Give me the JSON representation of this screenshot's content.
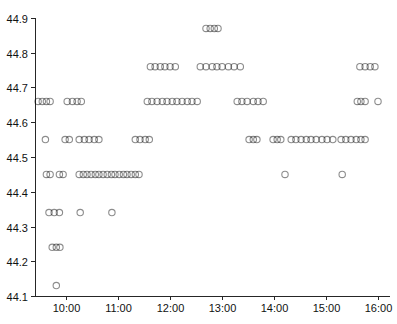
{
  "chart_data": {
    "type": "scatter",
    "title": "",
    "xlabel": "",
    "ylabel": "",
    "grid": false,
    "legend_position": "none",
    "background": "#ffffff",
    "axis_color": "#262626",
    "label_color": "#111111",
    "xlim_hours": [
      9.4,
      16.23
    ],
    "ylim": [
      44.1,
      44.9
    ],
    "x_ticks": [
      {
        "hour": 10,
        "label": "10:00"
      },
      {
        "hour": 11,
        "label": "11:00"
      },
      {
        "hour": 12,
        "label": "12:00"
      },
      {
        "hour": 13,
        "label": "13:00"
      },
      {
        "hour": 14,
        "label": "14:00"
      },
      {
        "hour": 15,
        "label": "15:00"
      },
      {
        "hour": 16,
        "label": "16:00"
      }
    ],
    "y_ticks": [
      {
        "value": 44.1,
        "label": "44.1"
      },
      {
        "value": 44.2,
        "label": "44.2"
      },
      {
        "value": 44.3,
        "label": "44.3"
      },
      {
        "value": 44.4,
        "label": "44.4"
      },
      {
        "value": 44.5,
        "label": "44.5"
      },
      {
        "value": 44.6,
        "label": "44.6"
      },
      {
        "value": 44.7,
        "label": "44.7"
      },
      {
        "value": 44.8,
        "label": "44.8"
      },
      {
        "value": 44.9,
        "label": "44.9"
      }
    ],
    "marker": {
      "shape": "circle",
      "radius": 3.2,
      "stroke": "rgba(0,0,0,0.45)",
      "stroke_width": 1.1,
      "fill": "none"
    },
    "series": [
      {
        "name": "price-observations",
        "levels": [
          {
            "price": 44.87,
            "times": [
              12.69,
              12.77,
              12.85,
              12.92
            ]
          },
          {
            "price": 44.76,
            "times": [
              11.62,
              11.71,
              11.81,
              11.9,
              12.0,
              12.1,
              12.58,
              12.69,
              12.81,
              12.9,
              13.0,
              13.12,
              13.23,
              13.35,
              15.65,
              15.75,
              15.85,
              15.94
            ]
          },
          {
            "price": 44.66,
            "times": [
              9.46,
              9.54,
              9.62,
              9.69,
              10.02,
              10.12,
              10.21,
              10.29,
              11.56,
              11.65,
              11.75,
              11.85,
              11.94,
              12.04,
              12.13,
              12.23,
              12.33,
              12.42,
              12.52,
              13.29,
              13.38,
              13.48,
              13.6,
              13.69,
              13.79,
              15.6,
              15.67,
              15.75,
              16.0
            ]
          },
          {
            "price": 44.55,
            "times": [
              9.6,
              9.98,
              10.06,
              10.25,
              10.35,
              10.44,
              10.54,
              10.63,
              11.33,
              11.42,
              11.52,
              11.6,
              13.52,
              13.6,
              13.67,
              13.98,
              14.06,
              14.13,
              14.33,
              14.42,
              14.52,
              14.62,
              14.71,
              14.81,
              14.92,
              15.02,
              15.13,
              15.29,
              15.38,
              15.48,
              15.58,
              15.67,
              15.75
            ]
          },
          {
            "price": 44.45,
            "times": [
              9.62,
              9.69,
              9.87,
              9.94,
              10.25,
              10.33,
              10.4,
              10.48,
              10.56,
              10.63,
              10.71,
              10.79,
              10.87,
              10.94,
              11.02,
              11.1,
              11.17,
              11.25,
              11.33,
              11.4,
              14.21,
              15.31
            ]
          },
          {
            "price": 44.34,
            "times": [
              9.67,
              9.77,
              9.87,
              10.27,
              10.88
            ]
          },
          {
            "price": 44.24,
            "times": [
              9.73,
              9.81,
              9.88
            ]
          },
          {
            "price": 44.13,
            "times": [
              9.81
            ]
          }
        ]
      }
    ]
  }
}
